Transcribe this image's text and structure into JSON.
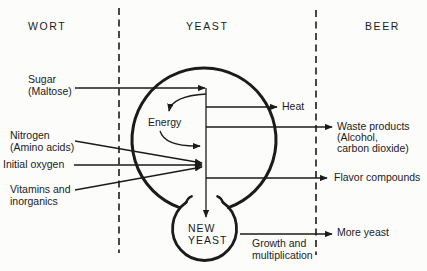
{
  "columns": {
    "wort": "WORT",
    "yeast": "YEAST",
    "beer": "BEER"
  },
  "inputs": {
    "sugar_line1": "Sugar",
    "sugar_line2": "(Maltose)",
    "nitrogen_line1": "Nitrogen",
    "nitrogen_line2": "(Amino acids)",
    "oxygen": "Initial oxygen",
    "vitamins_line1": "Vitamins and",
    "vitamins_line2": "inorganics"
  },
  "cell": {
    "energy": "Energy",
    "new_yeast_line1": "NEW",
    "new_yeast_line2": "YEAST"
  },
  "outputs": {
    "heat": "Heat",
    "waste_line1": "Waste products",
    "waste_line2": "(Alcohol,",
    "waste_line3": "carbon dioxide)",
    "flavor": "Flavor compounds",
    "more_yeast": "More yeast",
    "growth_line1": "Growth and",
    "growth_line2": "multiplication"
  },
  "colors": {
    "ink": "#1b1b1b",
    "background": "#fcfcfa"
  }
}
